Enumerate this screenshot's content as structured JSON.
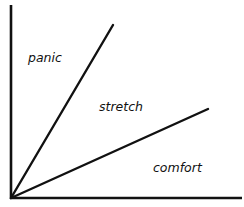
{
  "diagram": {
    "type": "zones-diagram",
    "stroke_color": "#111111",
    "background": "#ffffff",
    "axes": {
      "origin": [
        11,
        198
      ],
      "y_axis_top": [
        11,
        5
      ],
      "x_axis_right": [
        242,
        198
      ]
    },
    "lines": [
      {
        "name": "panic-stretch-boundary",
        "from": [
          11,
          198
        ],
        "to": [
          113,
          25
        ]
      },
      {
        "name": "stretch-comfort-boundary",
        "from": [
          11,
          198
        ],
        "to": [
          208,
          109
        ]
      }
    ],
    "zones": [
      {
        "id": "panic",
        "label": "panic",
        "x": 28,
        "y": 62
      },
      {
        "id": "stretch",
        "label": "stretch",
        "x": 99,
        "y": 111
      },
      {
        "id": "comfort",
        "label": "comfort",
        "x": 153,
        "y": 172
      }
    ]
  }
}
